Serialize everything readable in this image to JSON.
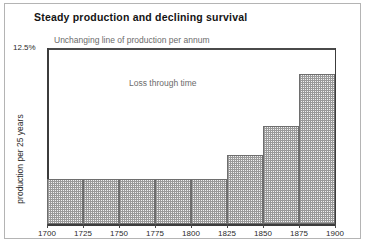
{
  "figure": {
    "title": "Steady production and declining survival",
    "y_axis_label": "production per 25 years",
    "y_top_label": "12.5%",
    "annotations": {
      "production_line": "Unchanging line of production per annum",
      "loss_region": "Loss through time",
      "survivors_region": "Survivors in 1980"
    }
  },
  "chart_data": {
    "type": "bar",
    "title": "Steady production and declining survival",
    "xlabel": "",
    "ylabel": "production per 25 years",
    "categories": [
      "1700",
      "1725",
      "1750",
      "1775",
      "1800",
      "1825",
      "1850",
      "1875"
    ],
    "bin_edges": [
      "1700",
      "1725",
      "1750",
      "1775",
      "1800",
      "1825",
      "1850",
      "1875",
      "1900"
    ],
    "values": [
      3.2,
      3.2,
      3.2,
      3.2,
      3.2,
      4.9,
      7.0,
      10.7
    ],
    "ylim": [
      0,
      12.5
    ],
    "ytick_labels": [
      "12.5%"
    ],
    "xtick_labels": [
      "1700",
      "1725",
      "1750",
      "1775",
      "1800",
      "1825",
      "1850",
      "1875",
      "1900"
    ],
    "reference_line": {
      "value": 12.5,
      "label": "Unchanging line of production per annum"
    },
    "grid": false,
    "legend": "none",
    "annotations": [
      "Loss through time",
      "Survivors in 1980"
    ]
  },
  "style": {
    "bar_fill": "#f2f2f2",
    "bar_edge": "#6e6e6e",
    "axis_color": "#3c3c3c",
    "frame_color": "#b4b4b4",
    "annotation_color": "#6b6b6b"
  }
}
